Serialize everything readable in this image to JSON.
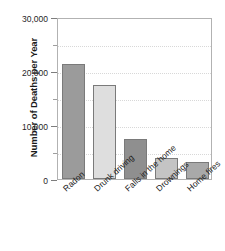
{
  "chart_data": {
    "type": "bar",
    "title": "",
    "xlabel": "",
    "ylabel": "Number of Deaths per Year",
    "categories": [
      "Radon",
      "Drunk driving",
      "Falls in the home",
      "Drownings",
      "Home fires"
    ],
    "values": [
      21300,
      17400,
      7400,
      3900,
      3100
    ],
    "ylim": [
      0,
      30000
    ],
    "ytick_labels": [
      "0",
      "10,000",
      "20,000",
      "30,000"
    ],
    "ytick_values": [
      0,
      10000,
      20000,
      30000
    ],
    "yminor_values": [
      5000,
      15000,
      25000
    ],
    "grid": true,
    "legend": "none",
    "bar_colors": [
      "#9b9b9b",
      "#dedede",
      "#8f8f8f",
      "#c4c4c4",
      "#a9a9a9"
    ],
    "bar_border_color": "#7a7a7a",
    "axis_color": "#b2b2b2",
    "gridline_color": "#d8d8d8",
    "background": "#ffffff"
  }
}
